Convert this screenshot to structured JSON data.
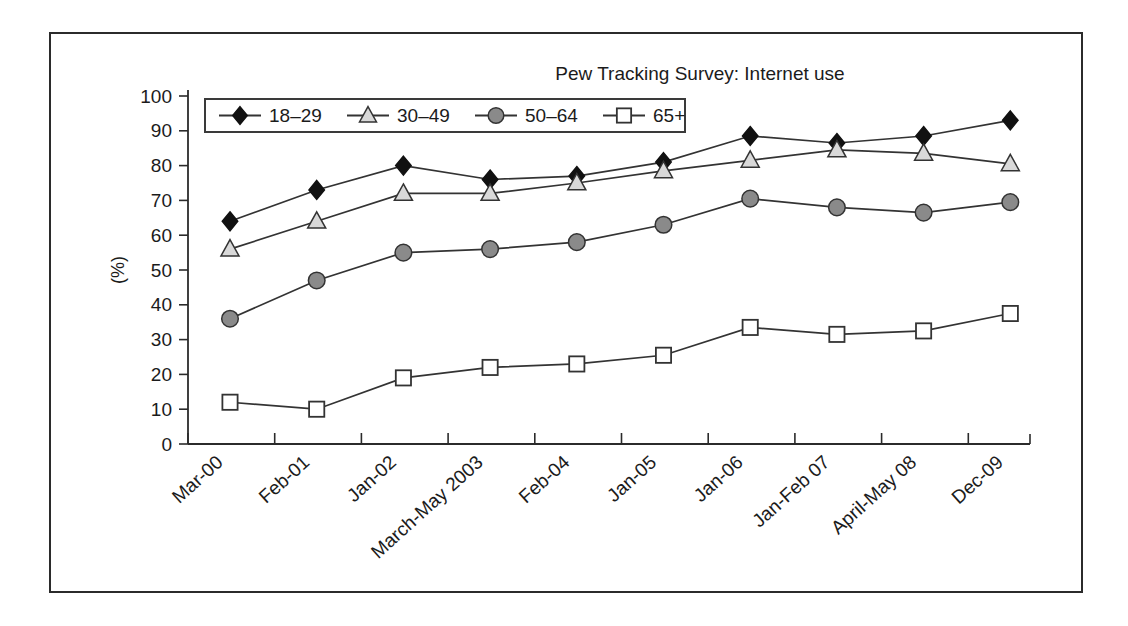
{
  "chart_data": {
    "type": "line",
    "title": "Pew Tracking Survey: Internet use",
    "xlabel": "",
    "ylabel": "(%)",
    "ylim": [
      0,
      100
    ],
    "ytick_step": 10,
    "yticks": [
      "0",
      "10",
      "20",
      "30",
      "40",
      "50",
      "60",
      "70",
      "80",
      "90",
      "100"
    ],
    "grid": false,
    "legend_position": "top-left inside plot",
    "categories": [
      "Mar-00",
      "Feb-01",
      "Jan-02",
      "March-May 2003",
      "Feb-04",
      "Jan-05",
      "Jan-06",
      "Jan-Feb 07",
      "April-May 08",
      "Dec-09"
    ],
    "series": [
      {
        "name": "18–29",
        "marker": "diamond",
        "marker_fill": "#111111",
        "marker_edge": "#111111",
        "line_color": "#333333",
        "values": [
          64,
          73,
          80,
          76,
          77,
          81,
          88.5,
          86.5,
          88.5,
          93
        ]
      },
      {
        "name": "30–49",
        "marker": "triangle",
        "marker_fill": "#d9d9d9",
        "marker_edge": "#333333",
        "line_color": "#333333",
        "values": [
          56,
          64,
          72,
          72,
          75,
          78.5,
          81.5,
          84.5,
          83.5,
          80.5
        ]
      },
      {
        "name": "50–64",
        "marker": "circle",
        "marker_fill": "#8a8a8a",
        "marker_edge": "#333333",
        "line_color": "#333333",
        "values": [
          36,
          47,
          55,
          56,
          58,
          63,
          70.5,
          68,
          66.5,
          69.5
        ]
      },
      {
        "name": "65+",
        "marker": "square",
        "marker_fill": "#ffffff",
        "marker_edge": "#333333",
        "line_color": "#333333",
        "values": [
          12,
          10,
          19,
          22,
          23,
          25.5,
          33.5,
          31.5,
          32.5,
          37.5
        ]
      }
    ]
  }
}
